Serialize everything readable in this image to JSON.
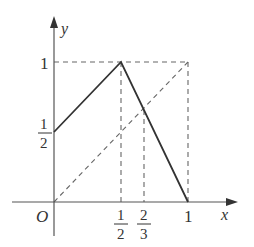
{
  "diagram": {
    "type": "function-graph",
    "axes": {
      "x_label": "x",
      "y_label": "y",
      "origin_label": "O"
    },
    "x_ticks": [
      {
        "num": "1",
        "den": "2",
        "value": 0.5
      },
      {
        "num": "2",
        "den": "3",
        "value": 0.6667
      },
      {
        "label": "1",
        "value": 1
      }
    ],
    "y_ticks": [
      {
        "num": "1",
        "den": "2",
        "value": 0.5
      },
      {
        "label": "1",
        "value": 1
      }
    ],
    "solid_path": [
      [
        0,
        0.5
      ],
      [
        0.5,
        1
      ],
      [
        1,
        0
      ]
    ],
    "dashed_lines": [
      {
        "name": "y-equals-1",
        "from": [
          0,
          1
        ],
        "to": [
          1,
          1
        ]
      },
      {
        "name": "x-equals-1",
        "from": [
          1,
          0
        ],
        "to": [
          1,
          1
        ]
      },
      {
        "name": "x-equals-half",
        "from": [
          0.5,
          0
        ],
        "to": [
          0.5,
          1
        ]
      },
      {
        "name": "x-equals-two-thirds",
        "from": [
          0.6667,
          0
        ],
        "to": [
          0.6667,
          0.6667
        ]
      },
      {
        "name": "diagonal-y-equals-x",
        "from": [
          0,
          0
        ],
        "to": [
          1,
          1
        ]
      }
    ],
    "colors": {
      "axis": "#555555",
      "solid": "#333333",
      "dashed": "#666666"
    }
  }
}
